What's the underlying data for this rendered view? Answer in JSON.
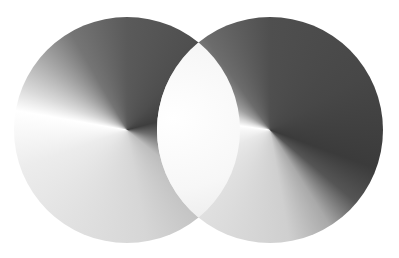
{
  "scene": {
    "description": "Two overlapping grayscale conic-gradient discs",
    "background": "#ffffff",
    "discs": [
      {
        "name": "left",
        "center": [
          127,
          130
        ],
        "radius": 113,
        "dark_tone": "#3e3e3e",
        "light_tone": "#ffffff"
      },
      {
        "name": "right",
        "center": [
          270,
          130
        ],
        "radius": 113,
        "dark_tone": "#3b3b3b",
        "light_tone": "#ffffff"
      }
    ],
    "overlap_tone": "#f4f4f4"
  }
}
